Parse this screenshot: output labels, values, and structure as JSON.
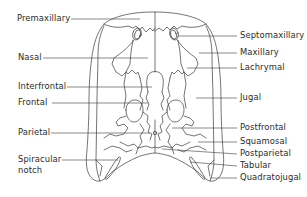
{
  "figure": {
    "type": "anatomical-diagram",
    "stroke_color": "#3a3a3a",
    "background": "#ffffff"
  },
  "labels_left": [
    {
      "id": "premaxillary",
      "text": "Premaxillary",
      "x": 17,
      "y": 15,
      "line": [
        71,
        19,
        140,
        19
      ]
    },
    {
      "id": "nasal",
      "text": "Nasal",
      "x": 18,
      "y": 54,
      "line": [
        43,
        58,
        148,
        58
      ]
    },
    {
      "id": "interfrontal",
      "text": "Interfrontal",
      "x": 18,
      "y": 83,
      "line": [
        67,
        87,
        152,
        87
      ]
    },
    {
      "id": "frontal",
      "text": "Frontal",
      "x": 18,
      "y": 99,
      "line": [
        52,
        103,
        148,
        103
      ]
    },
    {
      "id": "parietal",
      "text": "Parietal",
      "x": 18,
      "y": 129,
      "line": [
        51,
        133,
        150,
        133
      ]
    },
    {
      "id": "spiracular-notch",
      "text": "Spiracular\nnotch",
      "line1": "Spiracular",
      "line2": "notch",
      "x": 18,
      "y": 155,
      "line": [
        62,
        160,
        118,
        160
      ]
    }
  ],
  "labels_right": [
    {
      "id": "septomaxillary",
      "text": "Septomaxillary",
      "x": 240,
      "y": 32,
      "line": [
        178,
        36,
        237,
        36
      ]
    },
    {
      "id": "maxillary",
      "text": "Maxillary",
      "x": 240,
      "y": 49,
      "line": [
        199,
        53,
        237,
        53
      ]
    },
    {
      "id": "lachrymal",
      "text": "Lachrymal",
      "x": 240,
      "y": 64,
      "line": [
        187,
        68,
        237,
        68
      ]
    },
    {
      "id": "jugal",
      "text": "Jugal",
      "x": 240,
      "y": 94,
      "line": [
        196,
        98,
        237,
        98
      ]
    },
    {
      "id": "postfrontal",
      "text": "Postfrontal",
      "x": 240,
      "y": 124,
      "line": [
        172,
        128,
        237,
        128
      ]
    },
    {
      "id": "squamosal",
      "text": "Squamosal",
      "x": 240,
      "y": 138,
      "line": [
        198,
        142,
        237,
        142
      ]
    },
    {
      "id": "postparietal",
      "text": "Postparietal",
      "x": 240,
      "y": 150,
      "line": [
        162,
        149,
        237,
        154
      ]
    },
    {
      "id": "tabular",
      "text": "Tabular",
      "x": 240,
      "y": 162,
      "line": [
        190,
        162,
        237,
        166
      ]
    },
    {
      "id": "quadratojugal",
      "text": "Quadratojugal",
      "x": 240,
      "y": 174,
      "line": [
        210,
        178,
        237,
        178
      ]
    }
  ]
}
